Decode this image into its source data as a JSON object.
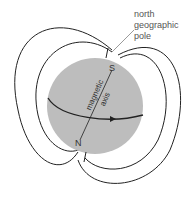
{
  "diagram": {
    "type": "earth magnetic field",
    "labels": {
      "north_line1": "north",
      "north_line2": "geographic",
      "north_line3": "pole",
      "axis_line1": "magnetic",
      "axis_line2": "axis",
      "pole_s": "S",
      "pole_n": "N"
    },
    "colors": {
      "sphere": "#bdbdbd",
      "lines": "#222222",
      "label": "#555555"
    }
  }
}
